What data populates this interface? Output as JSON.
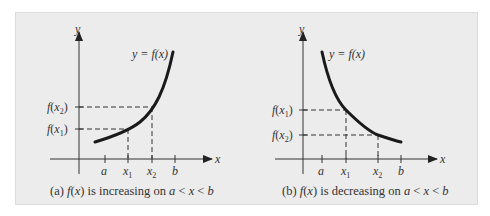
{
  "figure": {
    "background": "#ececec",
    "curve_color": "#1a1a1a",
    "axis_color": "#333333",
    "panels": [
      {
        "id": "a",
        "caption_prefix": "(a) ",
        "caption_fx": "f(x)",
        "caption_mid": " is increasing on ",
        "caption_ineq": "a < x < b",
        "curve_label": "y = f(x)",
        "x_axis_label": "x",
        "y_axis_label": "y",
        "x_ticks": [
          "a",
          "x1",
          "x2",
          "b"
        ],
        "y_levels": [
          "f(x2)",
          "f(x1)"
        ],
        "behavior": "increasing"
      },
      {
        "id": "b",
        "caption_prefix": "(b) ",
        "caption_fx": "f(x)",
        "caption_mid": " is decreasing on ",
        "caption_ineq": "a < x < b",
        "curve_label": "y = f(x)",
        "x_axis_label": "x",
        "y_axis_label": "y",
        "x_ticks": [
          "a",
          "x1",
          "x2",
          "b"
        ],
        "y_levels": [
          "f(x1)",
          "f(x2)"
        ],
        "behavior": "decreasing"
      }
    ]
  }
}
